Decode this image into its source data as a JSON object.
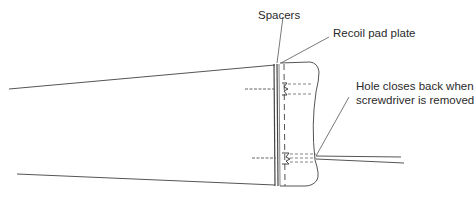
{
  "diagram": {
    "labels": {
      "spacers": "Spacers",
      "recoil_pad_plate": "Recoil pad plate",
      "hole_line1": "Hole closes back when",
      "hole_line2": "screwdriver is removed"
    },
    "colors": {
      "stroke": "#555555",
      "text": "#2a2a2a",
      "background": "#ffffff"
    }
  }
}
